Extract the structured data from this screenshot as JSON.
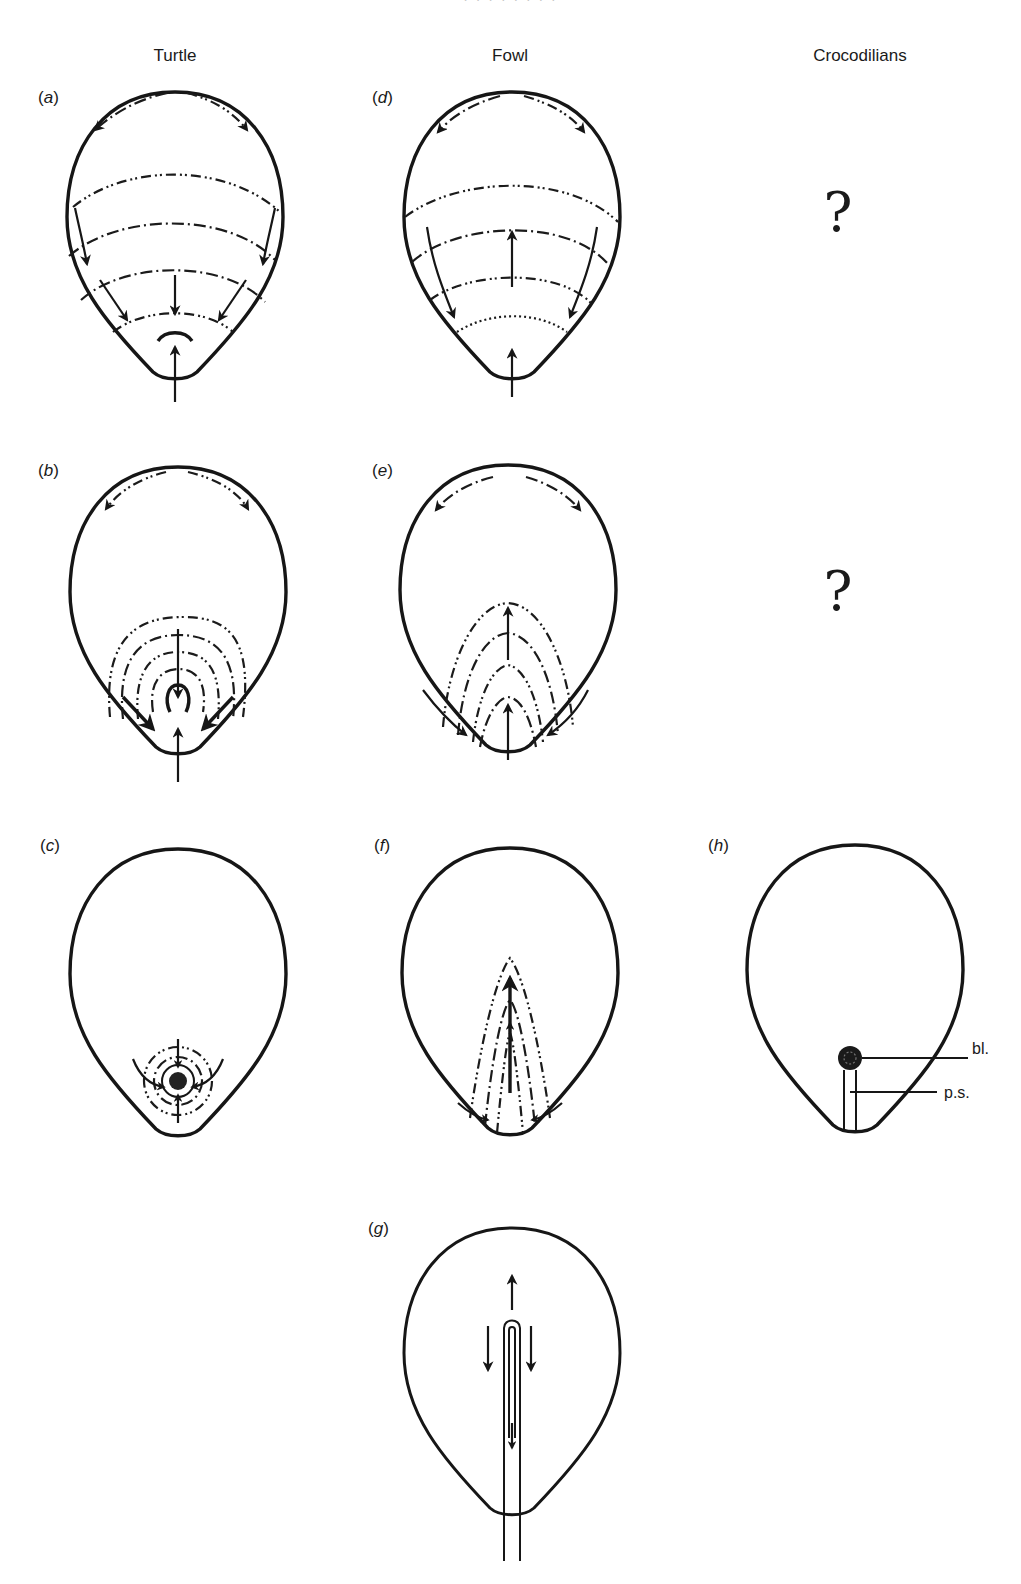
{
  "figure": {
    "top_caption_cut": "· · · · · · · ·",
    "column_headers": [
      {
        "id": "turtle",
        "label": "Turtle"
      },
      {
        "id": "fowl",
        "label": "Fowl"
      },
      {
        "id": "crocodilians",
        "label": "Crocodilians"
      }
    ],
    "panels": {
      "a": {
        "label": "a",
        "column": "Turtle",
        "row": 1
      },
      "b": {
        "label": "b",
        "column": "Turtle",
        "row": 2
      },
      "c": {
        "label": "c",
        "column": "Turtle",
        "row": 3
      },
      "d": {
        "label": "d",
        "column": "Fowl",
        "row": 1
      },
      "e": {
        "label": "e",
        "column": "Fowl",
        "row": 2
      },
      "f": {
        "label": "f",
        "column": "Fowl",
        "row": 3
      },
      "g": {
        "label": "g",
        "column": "Fowl",
        "row": 4
      },
      "h": {
        "label": "h",
        "column": "Crocodilians",
        "row": 3
      }
    },
    "unknown_markers": [
      {
        "row": 1,
        "column": "Crocodilians",
        "symbol": "?"
      },
      {
        "row": 2,
        "column": "Crocodilians",
        "symbol": "?"
      }
    ],
    "annotations": {
      "blastopore": "bl.",
      "primitive_streak": "p.s."
    },
    "colors": {
      "ink": "#161616",
      "background": "#ffffff"
    }
  }
}
